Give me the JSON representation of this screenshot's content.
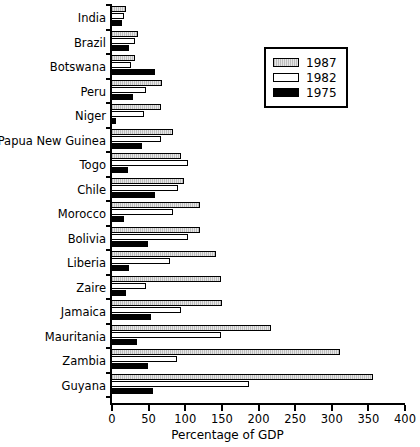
{
  "chart_data": {
    "type": "bar",
    "orientation": "horizontal",
    "title": "",
    "xlabel": "Percentage of GDP",
    "ylabel": "",
    "xlim": [
      0,
      400
    ],
    "xticks": [
      0,
      50,
      100,
      150,
      200,
      250,
      300,
      350,
      400
    ],
    "grid": false,
    "legend_position": "upper right",
    "categories": [
      "India",
      "Brazil",
      "Botswana",
      "Peru",
      "Niger",
      "Papua New Guinea",
      "Togo",
      "Chile",
      "Morocco",
      "Bolivia",
      "Liberia",
      "Zaire",
      "Jamaica",
      "Mauritania",
      "Zambia",
      "Guyana"
    ],
    "series": [
      {
        "name": "1987",
        "color": "#c8c8c8",
        "values": [
          20,
          37,
          33,
          70,
          68,
          85,
          95,
          100,
          122,
          122,
          143,
          150,
          152,
          218,
          312,
          358
        ]
      },
      {
        "name": "1982",
        "color": "#ffffff",
        "values": [
          18,
          33,
          27,
          48,
          45,
          68,
          105,
          92,
          85,
          105,
          80,
          48,
          95,
          150,
          90,
          188
        ]
      },
      {
        "name": "1975",
        "color": "#000000",
        "values": [
          15,
          25,
          60,
          30,
          7,
          42,
          23,
          60,
          18,
          50,
          25,
          20,
          55,
          35,
          50,
          57
        ]
      }
    ]
  },
  "legend": {
    "entries": [
      {
        "label": "1987",
        "swatch": "gray-hatched-swatch"
      },
      {
        "label": "1982",
        "swatch": "white-swatch"
      },
      {
        "label": "1975",
        "swatch": "black-swatch"
      }
    ]
  },
  "axis": {
    "x_title": "Percentage of GDP",
    "x_tick_labels": [
      "0",
      "50",
      "100",
      "150",
      "200",
      "250",
      "300",
      "350",
      "400"
    ]
  }
}
